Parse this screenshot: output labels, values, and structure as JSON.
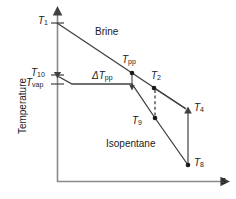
{
  "figure": {
    "type": "temperature-entropy-diagram",
    "background": "#ffffff",
    "line_color": "#404040",
    "text_color": "#1a1a1a"
  },
  "axes": {
    "y_label": "Temperature",
    "x_label": "s",
    "origin": [
      57,
      182
    ],
    "y_top": [
      57,
      10
    ],
    "x_right": [
      228,
      182
    ]
  },
  "ticks": [
    {
      "name": "T1",
      "base": "T",
      "sub": "1",
      "y": 23,
      "label_x": 38,
      "label_y": 16
    },
    {
      "name": "T10",
      "base": "T",
      "sub": "10",
      "y": 75,
      "label_x": 32,
      "label_y": 68
    },
    {
      "name": "Tvap",
      "base": "T",
      "sub": "vap",
      "y": 84,
      "label_x": 27,
      "label_y": 79
    }
  ],
  "curves": {
    "brine": {
      "label": "Brine",
      "label_x": 95,
      "label_y": 28,
      "points": [
        [
          57,
          23
        ],
        [
          132,
          73
        ],
        [
          186,
          109
        ]
      ],
      "end_marker": "triangle-up"
    },
    "isopentane": {
      "label": "Isopentane",
      "label_x": 106,
      "label_y": 140,
      "points": [
        [
          57,
          75
        ],
        [
          72,
          84
        ],
        [
          132,
          84
        ],
        [
          155,
          118
        ],
        [
          188,
          165
        ]
      ],
      "start_marker": "triangle-down"
    },
    "segment_T2_T4": {
      "points": [
        [
          154,
          88
        ],
        [
          186,
          109
        ]
      ]
    },
    "segment_T4_T8": {
      "points": [
        [
          188,
          110
        ],
        [
          188,
          165
        ]
      ]
    },
    "dashed_T2_T9": {
      "points": [
        [
          155,
          89
        ],
        [
          155,
          118
        ]
      ],
      "style": "dashed"
    },
    "pinch_arrow": {
      "points": [
        [
          132,
          74
        ],
        [
          132,
          88
        ]
      ],
      "marker": "arrow-down"
    }
  },
  "points": [
    {
      "name": "Tpp",
      "base": "T",
      "sub": "pp",
      "x": 132,
      "y": 73,
      "label_x": 122,
      "label_y": 55,
      "dot": true
    },
    {
      "name": "T2",
      "base": "T",
      "sub": "2",
      "x": 154,
      "y": 88,
      "label_x": 152,
      "label_y": 71,
      "dot": true
    },
    {
      "name": "T9",
      "base": "T",
      "sub": "9",
      "x": 155,
      "y": 118,
      "label_x": 133,
      "label_y": 117,
      "dot": true
    },
    {
      "name": "T4",
      "base": "T",
      "sub": "4",
      "x": 188,
      "y": 110,
      "label_x": 194,
      "label_y": 103,
      "dot": false
    },
    {
      "name": "T8",
      "base": "T",
      "sub": "8",
      "x": 188,
      "y": 165,
      "label_x": 194,
      "label_y": 158,
      "dot": true
    }
  ],
  "annotations": [
    {
      "name": "delta-T-pp",
      "prefix": "Δ",
      "base": "T",
      "sub": "pp",
      "label_x": 93,
      "label_y": 72
    }
  ]
}
